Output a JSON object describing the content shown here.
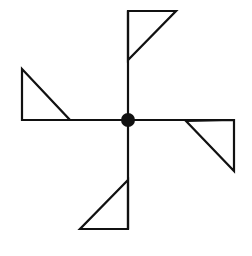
{
  "diagram": {
    "type": "pinwheel-figure",
    "stroke_color": "#111111",
    "background": "#ffffff",
    "center": {
      "x": 128,
      "y": 120,
      "radius": 7
    },
    "arms": [
      {
        "name": "top",
        "line": [
          128,
          120,
          128,
          11
        ],
        "flag": [
          [
            128,
            11
          ],
          [
            176,
            11
          ],
          [
            128,
            60
          ]
        ]
      },
      {
        "name": "right",
        "line": [
          128,
          120,
          234,
          120
        ],
        "flag": [
          [
            234,
            120
          ],
          [
            234,
            171
          ],
          [
            186,
            121
          ]
        ]
      },
      {
        "name": "bottom",
        "line": [
          128,
          120,
          128,
          229
        ],
        "flag": [
          [
            128,
            229
          ],
          [
            80,
            229
          ],
          [
            128,
            180
          ]
        ]
      },
      {
        "name": "left",
        "line": [
          128,
          120,
          22,
          120
        ],
        "flag": [
          [
            22,
            120
          ],
          [
            22,
            69
          ],
          [
            70,
            120
          ]
        ]
      }
    ]
  }
}
